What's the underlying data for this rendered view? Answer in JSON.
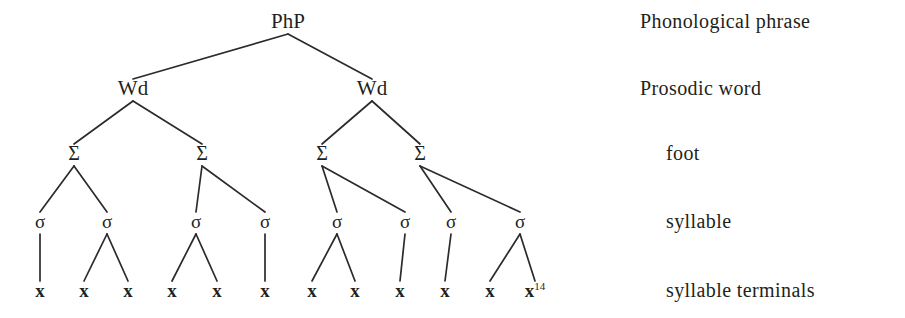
{
  "figure": {
    "kind": "prosodic-hierarchy-tree",
    "background_color": "#ffffff",
    "ink_color": "#231f20",
    "line_color": "#2c2a2b"
  },
  "tiers": [
    {
      "id": "php",
      "label": "Phonological phrase",
      "indent": "flush"
    },
    {
      "id": "wd",
      "label": "Prosodic word",
      "indent": "flush"
    },
    {
      "id": "foot",
      "label": "foot",
      "indent": "indented"
    },
    {
      "id": "syl",
      "label": "syllable",
      "indent": "indented"
    },
    {
      "id": "term",
      "label": "syllable terminals",
      "indent": "indented"
    }
  ],
  "nodes": {
    "root": [
      {
        "id": "php",
        "text": "PhP",
        "x": 288,
        "y": 28
      }
    ],
    "words": [
      {
        "id": "wd1",
        "text": "Wd",
        "x": 133,
        "y": 95
      },
      {
        "id": "wd2",
        "text": "Wd",
        "x": 372,
        "y": 95
      }
    ],
    "feet": [
      {
        "id": "f1",
        "text": "Σ",
        "x": 74,
        "y": 160
      },
      {
        "id": "f2",
        "text": "Σ",
        "x": 202,
        "y": 160
      },
      {
        "id": "f3",
        "text": "Σ",
        "x": 322,
        "y": 160
      },
      {
        "id": "f4",
        "text": "Σ",
        "x": 420,
        "y": 160
      }
    ],
    "syllables": [
      {
        "id": "s1",
        "text": "σ",
        "x": 40,
        "y": 228
      },
      {
        "id": "s2",
        "text": "σ",
        "x": 107,
        "y": 228
      },
      {
        "id": "s3",
        "text": "σ",
        "x": 196,
        "y": 228
      },
      {
        "id": "s4",
        "text": "σ",
        "x": 265,
        "y": 228
      },
      {
        "id": "s5",
        "text": "σ",
        "x": 337,
        "y": 228
      },
      {
        "id": "s6",
        "text": "σ",
        "x": 405,
        "y": 228
      },
      {
        "id": "s7",
        "text": "σ",
        "x": 451,
        "y": 228
      },
      {
        "id": "s8",
        "text": "σ",
        "x": 520,
        "y": 228
      }
    ],
    "terminals": [
      {
        "id": "x1",
        "text": "x",
        "x": 40,
        "y": 297,
        "sup": ""
      },
      {
        "id": "x2",
        "text": "x",
        "x": 84,
        "y": 297,
        "sup": ""
      },
      {
        "id": "x3",
        "text": "x",
        "x": 128,
        "y": 297,
        "sup": ""
      },
      {
        "id": "x4",
        "text": "x",
        "x": 172,
        "y": 297,
        "sup": ""
      },
      {
        "id": "x5",
        "text": "x",
        "x": 217,
        "y": 297,
        "sup": ""
      },
      {
        "id": "x6",
        "text": "x",
        "x": 265,
        "y": 297,
        "sup": ""
      },
      {
        "id": "x7",
        "text": "x",
        "x": 312,
        "y": 297,
        "sup": ""
      },
      {
        "id": "x8",
        "text": "x",
        "x": 355,
        "y": 297,
        "sup": ""
      },
      {
        "id": "x9",
        "text": "x",
        "x": 400,
        "y": 297,
        "sup": ""
      },
      {
        "id": "x10",
        "text": "x",
        "x": 445,
        "y": 297,
        "sup": ""
      },
      {
        "id": "x11",
        "text": "x",
        "x": 490,
        "y": 297,
        "sup": ""
      },
      {
        "id": "x12",
        "text": "x",
        "x": 535,
        "y": 297,
        "sup": "14"
      }
    ]
  },
  "edges": [
    {
      "from": "php",
      "to": "wd1"
    },
    {
      "from": "php",
      "to": "wd2"
    },
    {
      "from": "wd1",
      "to": "f1"
    },
    {
      "from": "wd1",
      "to": "f2"
    },
    {
      "from": "wd2",
      "to": "f3"
    },
    {
      "from": "wd2",
      "to": "f4"
    },
    {
      "from": "f1",
      "to": "s1"
    },
    {
      "from": "f1",
      "to": "s2"
    },
    {
      "from": "f2",
      "to": "s3"
    },
    {
      "from": "f2",
      "to": "s4"
    },
    {
      "from": "f3",
      "to": "s5"
    },
    {
      "from": "f3",
      "to": "s6"
    },
    {
      "from": "f4",
      "to": "s7"
    },
    {
      "from": "f4",
      "to": "s8"
    },
    {
      "from": "s1",
      "to": "x1"
    },
    {
      "from": "s2",
      "to": "x2"
    },
    {
      "from": "s2",
      "to": "x3"
    },
    {
      "from": "s3",
      "to": "x4"
    },
    {
      "from": "s3",
      "to": "x5"
    },
    {
      "from": "s4",
      "to": "x6"
    },
    {
      "from": "s5",
      "to": "x7"
    },
    {
      "from": "s5",
      "to": "x8"
    },
    {
      "from": "s6",
      "to": "x9"
    },
    {
      "from": "s7",
      "to": "x10"
    },
    {
      "from": "s8",
      "to": "x11"
    },
    {
      "from": "s8",
      "to": "x12"
    }
  ],
  "tier_label_positions": {
    "flush_x": 640,
    "indented_x": 666,
    "rows": [
      28,
      95,
      160,
      228,
      297
    ]
  }
}
